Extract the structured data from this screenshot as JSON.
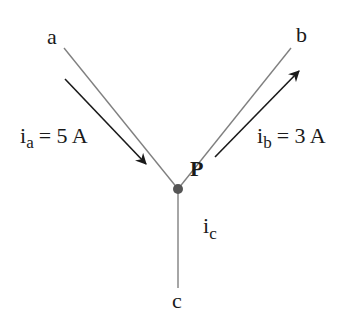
{
  "diagram": {
    "node": {
      "label": "P"
    },
    "terminals": {
      "a": "a",
      "b": "b",
      "c": "c"
    },
    "currents": {
      "ia": {
        "main": "i",
        "sub": "a",
        "value": "= 5 A"
      },
      "ib": {
        "main": "i",
        "sub": "b",
        "value": "= 3 A"
      },
      "ic": {
        "main": "i",
        "sub": "c"
      }
    },
    "colors": {
      "wire": "#808080",
      "arrow": "#1a1a1a",
      "node": "#555555",
      "text": "#1a1a1a"
    }
  }
}
